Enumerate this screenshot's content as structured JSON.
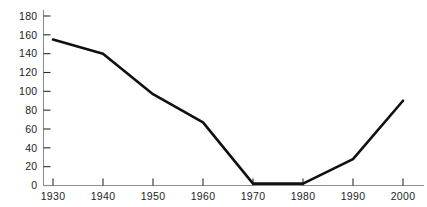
{
  "chart_data": {
    "type": "line",
    "title": "",
    "subtitle": "",
    "xlabel": "",
    "ylabel": "",
    "x": [
      1930,
      1940,
      1950,
      1960,
      1970,
      1980,
      1990,
      2000
    ],
    "values": [
      155,
      140,
      97,
      67,
      2,
      2,
      28,
      90
    ],
    "series": [
      {
        "name": "",
        "values": [
          155,
          140,
          97,
          67,
          2,
          2,
          28,
          90
        ]
      }
    ],
    "categories": [
      "1930",
      "1940",
      "1950",
      "1960",
      "1970",
      "1980",
      "1990",
      "2000"
    ],
    "xlim": [
      1925,
      2005
    ],
    "ylim": [
      0,
      180
    ],
    "yticks": [
      0,
      20,
      40,
      60,
      80,
      100,
      120,
      140,
      160,
      180
    ],
    "ytick_labels": [
      "0",
      "20",
      "40",
      "60",
      "80",
      "100",
      "120",
      "140",
      "160",
      "180"
    ],
    "xticks": [
      1930,
      1940,
      1950,
      1960,
      1970,
      1980,
      1990,
      2000
    ],
    "xtick_labels": [
      "1930",
      "1940",
      "1950",
      "1960",
      "1970",
      "1980",
      "1990",
      "2000"
    ],
    "grid": false,
    "legend": false,
    "legend_position": "none",
    "line_color": "#101010",
    "axis_color": "#8e8e8e",
    "tick_color": "#2b2b2b",
    "background_color": "#ffffff"
  }
}
